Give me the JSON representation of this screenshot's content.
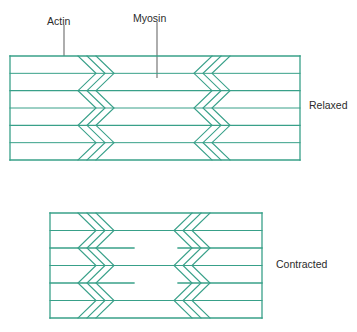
{
  "figure": {
    "labels": {
      "actin": "Actin",
      "myosin": "Myosin",
      "relaxed": "Relaxed",
      "contracted": "Contracted"
    },
    "colors": {
      "filament_green": "#38a089",
      "text": "#2b2b2b",
      "leader_line": "#6b6b6b",
      "background": "#ffffff"
    }
  },
  "leaders": [
    {
      "name": "actin-leader-line",
      "x": 64,
      "y1": 25,
      "y2": 56
    },
    {
      "name": "myosin-leader-line",
      "x": 157,
      "y1": 22,
      "y2": 78
    }
  ],
  "panels": [
    {
      "id": "relaxed",
      "state_label": "Relaxed",
      "left": 10,
      "right": 300,
      "top": 56,
      "bottom": 160,
      "bands": 3,
      "band_height": 34.7,
      "zigzag_left_start": 78,
      "zigzag_right_start": 212,
      "zigzag_count": 3,
      "zigzag_spacing": 9,
      "zigzag_amplitude": 18,
      "center_gap": false
    },
    {
      "id": "contracted",
      "state_label": "Contracted",
      "left": 50,
      "right": 262,
      "top": 213,
      "bottom": 318,
      "bands": 3,
      "band_height": 35,
      "zigzag_left_start": 78,
      "zigzag_right_start": 192,
      "zigzag_count": 3,
      "zigzag_spacing": 9,
      "zigzag_amplitude": 18,
      "center_gap": true,
      "center_gap_half_width": 22
    }
  ]
}
